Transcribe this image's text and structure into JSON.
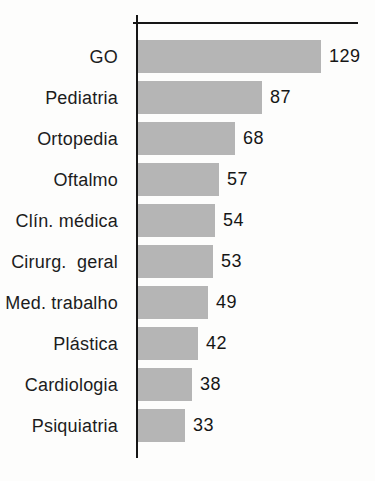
{
  "chart_data": {
    "type": "bar",
    "orientation": "horizontal",
    "title": "",
    "xlabel": "",
    "ylabel": "",
    "categories": [
      "GO",
      "Pediatria",
      "Ortopedia",
      "Oftalmo",
      "Clín. médica",
      "Cirurg.  geral",
      "Med. trabalho",
      "Plástica",
      "Cardiologia",
      "Psiquiatria"
    ],
    "values": [
      129,
      87,
      68,
      57,
      54,
      53,
      49,
      42,
      38,
      33
    ],
    "value_labels": [
      "129",
      "87",
      "68",
      "57",
      "54",
      "53",
      "49",
      "42",
      "38",
      "33"
    ],
    "xlim": [
      0,
      158
    ],
    "grid": false,
    "legend": "none",
    "bar_color": "#b5b5b5",
    "axis_color": "#161616",
    "text_color": "#1c1c1c"
  }
}
